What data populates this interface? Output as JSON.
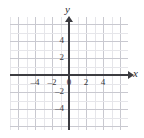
{
  "chart_data": {
    "type": "scatter",
    "title": "",
    "subtitle": "",
    "xlabel": "x",
    "ylabel": "y",
    "xlim": [
      -5,
      5
    ],
    "ylim": [
      -5,
      5
    ],
    "xticks": [
      -4,
      -2,
      0,
      2,
      4
    ],
    "yticks": [
      -4,
      -2,
      2,
      4
    ],
    "xtick_labels": [
      "–4",
      "–2",
      "0",
      "2",
      "4"
    ],
    "ytick_labels": [
      "4",
      "2",
      "–2",
      "–4"
    ],
    "origin_label": "0",
    "grid": true,
    "grid_major_step": 2,
    "grid_minor_step": 1,
    "legend": null,
    "annotations": [],
    "series": [],
    "values": [],
    "categories": []
  },
  "axes": {
    "y_name": "y",
    "x_name": "x"
  },
  "ticks": {
    "x": [
      {
        "value": -4,
        "label": "–4",
        "px": 35
      },
      {
        "value": -2,
        "label": "–2",
        "px": 52
      },
      {
        "value": 0,
        "label": "0",
        "px": 69
      },
      {
        "value": 2,
        "label": "2",
        "px": 86
      },
      {
        "value": 4,
        "label": "4",
        "px": 103
      }
    ],
    "y": [
      {
        "value": 4,
        "label": "4",
        "px": 40
      },
      {
        "value": 2,
        "label": "2",
        "px": 57
      },
      {
        "value": -2,
        "label": "–2",
        "px": 91
      },
      {
        "value": -4,
        "label": "–4",
        "px": 108
      }
    ]
  },
  "colors": {
    "axis": "#3c3c41",
    "grid_major": "#c9c9d0",
    "grid_minor": "#e6e6ea",
    "text": "#3a3a40",
    "background": "#ffffff"
  }
}
